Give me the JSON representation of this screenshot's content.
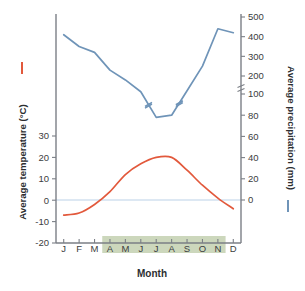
{
  "chart_data": {
    "type": "line",
    "title": "",
    "xlabel": "Month",
    "categories": [
      "J",
      "F",
      "M",
      "A",
      "M",
      "J",
      "J",
      "A",
      "S",
      "O",
      "N",
      "D"
    ],
    "grid": false,
    "legend_position": "axis-labels",
    "axes": {
      "left": {
        "label": "Average temperature (°C)",
        "unit": "°C",
        "ticks": [
          30,
          20,
          10,
          0,
          -10,
          -20
        ],
        "tick_labels": [
          "30",
          "20",
          "10",
          "0",
          "-10",
          "-20"
        ],
        "range": [
          -20,
          30
        ],
        "color": "#e2593c"
      },
      "right": {
        "label": "Average precipitation (mm)",
        "unit": "mm",
        "ticks": [
          0,
          20,
          40,
          60,
          80,
          100,
          200,
          300,
          400,
          500
        ],
        "tick_labels": [
          "0",
          "20",
          "40",
          "60",
          "80",
          "100",
          "200",
          "300",
          "400",
          "500"
        ],
        "range": [
          0,
          500
        ],
        "axis_break": true,
        "axis_break_between": [
          100,
          200
        ],
        "color": "#6f94b8"
      }
    },
    "series": [
      {
        "name": "Average temperature (°C)",
        "axis": "left",
        "color": "#e2593c",
        "unit": "°C",
        "values": [
          -7,
          -6,
          -2,
          4,
          12,
          17,
          20,
          20,
          14,
          7,
          1,
          -4
        ]
      },
      {
        "name": "Average precipitation (mm)",
        "axis": "right",
        "color": "#6f94b8",
        "unit": "mm",
        "values": [
          410,
          350,
          320,
          230,
          180,
          120,
          78,
          80,
          125,
          250,
          440,
          420
        ]
      }
    ],
    "annotations": [
      {
        "name": "growing-season-band",
        "label": "",
        "from": "A",
        "to": "N",
        "color": "#ccd7bc"
      },
      {
        "name": "zero-line",
        "label": "",
        "value": 0,
        "color": "#bcd2e8"
      }
    ]
  },
  "legend": {
    "temperature_dash": "—",
    "precipitation_dash": "—"
  }
}
